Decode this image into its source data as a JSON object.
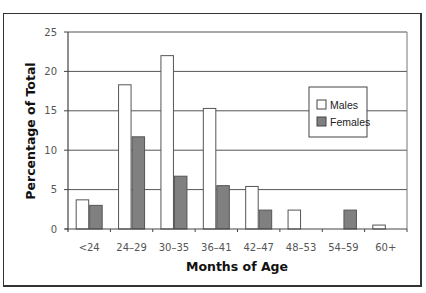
{
  "chart_data": {
    "type": "bar",
    "title": "",
    "xlabel": "Months of Age",
    "ylabel": "Percentage of Total",
    "categories": [
      "<24",
      "24–29",
      "30–35",
      "36–41",
      "42–47",
      "48–53",
      "54–59",
      "60+"
    ],
    "series": [
      {
        "name": "Males",
        "color": "#ffffff",
        "values": [
          3.7,
          18.3,
          22.0,
          15.3,
          5.4,
          2.4,
          0,
          0.5
        ]
      },
      {
        "name": "Females",
        "color": "#808080",
        "values": [
          3.0,
          11.7,
          6.7,
          5.5,
          2.4,
          0,
          2.4,
          0
        ]
      }
    ],
    "ylim": [
      0,
      25
    ],
    "yticks": [
      0,
      5,
      10,
      15,
      20,
      25
    ],
    "grid": true,
    "legend_position": "upper right (inside plot)"
  }
}
